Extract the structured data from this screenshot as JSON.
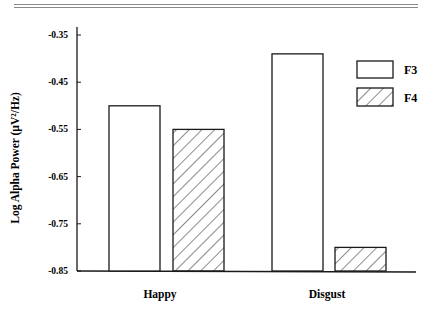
{
  "chart_data": {
    "type": "bar",
    "title": "",
    "xlabel": "",
    "ylabel": "Log Alpha Power (µV²/Hz)",
    "ylim": [
      -0.85,
      -0.35
    ],
    "yticks": [
      "-0.35",
      "-0.45",
      "-0.55",
      "-0.65",
      "-0.75",
      "-0.85"
    ],
    "ytick_values": [
      -0.35,
      -0.45,
      -0.55,
      -0.65,
      -0.75,
      -0.85
    ],
    "categories": [
      "Happy",
      "Disgust"
    ],
    "series": [
      {
        "name": "F3",
        "fill": "open",
        "values": [
          -0.5,
          -0.39
        ]
      },
      {
        "name": "F4",
        "fill": "hatched",
        "values": [
          -0.55,
          -0.8
        ]
      }
    ],
    "grid": false,
    "legend_position": "upper right",
    "colors": {
      "ink": "#1a1a1a",
      "rule": "#8a8a8a",
      "background": "#ffffff"
    }
  }
}
